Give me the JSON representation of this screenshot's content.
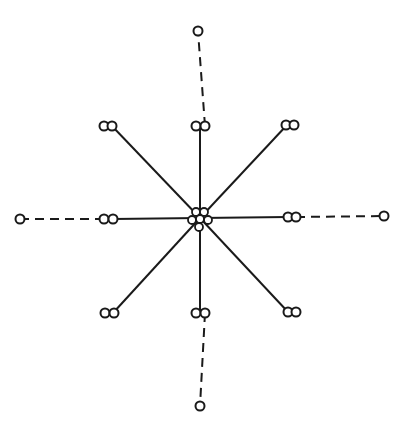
{
  "diagram": {
    "title": "",
    "colors": {
      "stroke": "#1a1a1a",
      "background": "#ffffff"
    },
    "hub": {
      "center": [
        200,
        218
      ],
      "circles": [
        {
          "cx": 196,
          "cy": 212,
          "r": 4
        },
        {
          "cx": 204,
          "cy": 212,
          "r": 4
        },
        {
          "cx": 192,
          "cy": 220,
          "r": 4
        },
        {
          "cx": 200,
          "cy": 219,
          "r": 4
        },
        {
          "cx": 208,
          "cy": 220,
          "r": 4
        },
        {
          "cx": 199,
          "cy": 227,
          "r": 4
        }
      ]
    },
    "spokes": [
      {
        "id": "north",
        "end": [
          200,
          126
        ],
        "pair": [
          [
            196,
            126
          ],
          [
            205,
            126
          ]
        ],
        "dashed_to": [
          198,
          31
        ]
      },
      {
        "id": "north-east",
        "end": [
          287,
          125
        ],
        "pair": [
          [
            286,
            125
          ],
          [
            294,
            125
          ]
        ],
        "dashed_to": null
      },
      {
        "id": "east",
        "end": [
          288,
          217
        ],
        "pair": [
          [
            288,
            217
          ],
          [
            296,
            217
          ]
        ],
        "dashed_to": [
          384,
          216
        ]
      },
      {
        "id": "south-east",
        "end": [
          288,
          312
        ],
        "pair": [
          [
            288,
            312
          ],
          [
            296,
            312
          ]
        ],
        "dashed_to": null
      },
      {
        "id": "south",
        "end": [
          200,
          313
        ],
        "pair": [
          [
            196,
            313
          ],
          [
            205,
            313
          ]
        ],
        "dashed_to": [
          200,
          406
        ]
      },
      {
        "id": "south-west",
        "end": [
          113,
          313
        ],
        "pair": [
          [
            105,
            313
          ],
          [
            114,
            313
          ]
        ],
        "dashed_to": null
      },
      {
        "id": "west",
        "end": [
          113,
          219
        ],
        "pair": [
          [
            104,
            219
          ],
          [
            113,
            219
          ]
        ],
        "dashed_to": [
          20,
          219
        ]
      },
      {
        "id": "north-west",
        "end": [
          112,
          126
        ],
        "pair": [
          [
            104,
            126
          ],
          [
            112,
            126
          ]
        ],
        "dashed_to": null
      }
    ],
    "pair_radius": 4.5,
    "terminal_radius": 4.5
  }
}
